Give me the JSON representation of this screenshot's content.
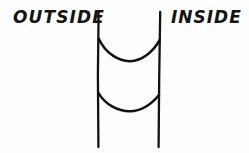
{
  "figure": {
    "background_color": "#fdfdfd",
    "ink_color": "#121212",
    "width": 249,
    "height": 153,
    "labels": {
      "left": "OUTSIDE",
      "right": "INSIDE"
    },
    "elements": {
      "left_wall": {
        "name": "left vertical line",
        "path": "M 98.6 12 L 97.9 75 L 98.4 147",
        "stroke_width": 2.3
      },
      "right_wall": {
        "name": "right vertical line",
        "path": "M 160.2 12 L 159.2 78 L 158.6 147",
        "stroke_width": 2.3
      },
      "upper_arc": {
        "name": "upper sagging curve",
        "path": "M 98.6 38.5 C 106 54.5 120 61.5 130 61.2 C 142 60.8 153 52 159.6 40.2",
        "stroke_width": 2.6
      },
      "lower_arc": {
        "name": "lower sagging curve",
        "path": "M 98.2 92.5 C 105 105 119 111.5 130 111.3 C 141.5 111 152 103.5 159 95.0",
        "stroke_width": 2.6
      }
    }
  }
}
